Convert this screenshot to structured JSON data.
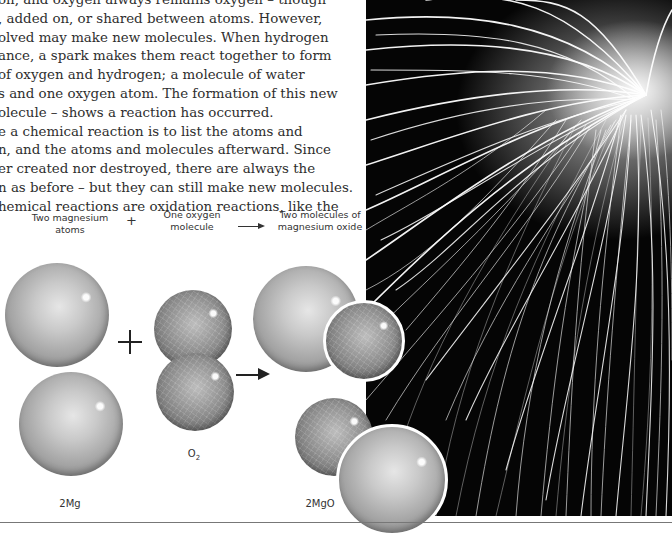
{
  "page": {
    "body_text_lines": [
      "on, and oxygen always remains oxygen – though",
      ", added on, or shared between atoms. However,",
      "olved may make new molecules. When hydrogen",
      "ance, a spark makes them react together to form",
      " of oxygen and hydrogen; a molecule of water",
      "s and one oxygen atom. The formation of this new",
      "olecule – shows a reaction has occurred.",
      "e a chemical reaction is to list the atoms and",
      "n, and the atoms and molecules afterward. Since",
      "er created nor destroyed, there are always the",
      "n as before – but they can still make new molecules.",
      "hemical reactions are oxidation reactions, like the"
    ]
  },
  "diagram": {
    "reactant1_label_line1": "Two magnesium",
    "reactant1_label_line2": "atoms",
    "plus_symbol": "+",
    "reactant2_label_line1": "One oxygen",
    "reactant2_label_line2": "molecule",
    "product_label_line1": "Two molecules of",
    "product_label_line2": "magnesium oxide",
    "reactant1_formula": "2Mg",
    "reactant2_formula_base": "O",
    "reactant2_formula_sub": "2",
    "product_formula": "2MgO"
  },
  "photo": {
    "subject": "fireworks-sparks",
    "colors": {
      "background": "#050505",
      "streak": "#ffffff"
    }
  }
}
